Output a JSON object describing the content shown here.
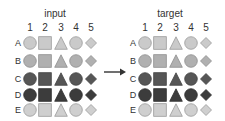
{
  "panels": [
    {
      "title": "input",
      "x_offset": 0,
      "columns": [
        "1",
        "2",
        "3",
        "4",
        "5"
      ],
      "rows": [
        {
          "label": "A",
          "fill": "#cacaca",
          "stroke": "#9a9a9a"
        },
        {
          "label": "B",
          "fill": "#b0b0b0",
          "stroke": "#8e8e8e"
        },
        {
          "label": "C",
          "fill": "#565656",
          "stroke": "#444444"
        },
        {
          "label": "D",
          "fill": "#3c3c3c",
          "stroke": "#2e2e2e"
        },
        {
          "label": "E",
          "fill": "#cfcfcf",
          "stroke": "#9a9a9a"
        }
      ],
      "shapes": [
        "circle",
        "square",
        "triangle",
        "circle",
        "diamond"
      ]
    },
    {
      "title": "target",
      "x_offset": 115,
      "columns": [
        "1",
        "2",
        "3",
        "4",
        "5"
      ],
      "rows": [
        {
          "label": "A",
          "fill": "#cacaca",
          "stroke": "#9a9a9a"
        },
        {
          "label": "B",
          "fill": "#b0b0b0",
          "stroke": "#8e8e8e"
        },
        {
          "label": "C",
          "fill": "#565656",
          "stroke": "#444444"
        },
        {
          "label": "D",
          "fill": "#3c3c3c",
          "stroke": "#2e2e2e"
        },
        {
          "label": "E",
          "fill": "#cfcfcf",
          "stroke": "#9a9a9a"
        }
      ],
      "shapes": [
        "circle",
        "square",
        "triangle",
        "circle",
        "diamond"
      ]
    }
  ],
  "arrow": {
    "icon": "right-arrow-icon",
    "color": "#333333"
  }
}
